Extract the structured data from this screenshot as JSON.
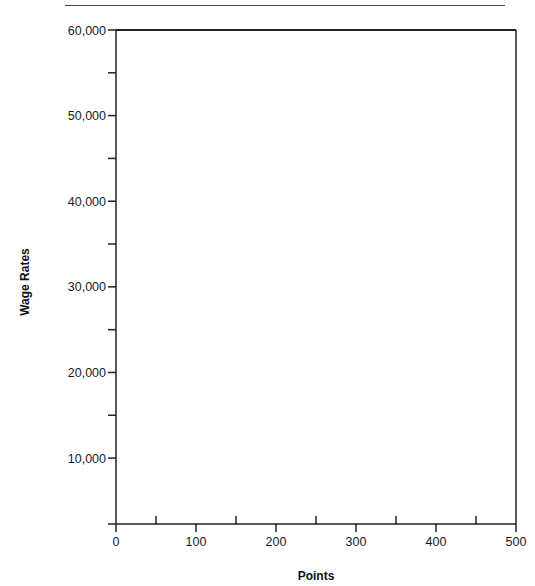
{
  "header": {
    "text": "…ing … g…"
  },
  "chart_data": {
    "type": "scatter",
    "title": "",
    "xlabel": "Points",
    "ylabel": "Wage Rates",
    "xlim": [
      0,
      500
    ],
    "ylim": [
      2300,
      60000
    ],
    "x_ticks": [
      0,
      100,
      200,
      300,
      400,
      500
    ],
    "x_tick_labels": [
      "0",
      "100",
      "200",
      "300",
      "400",
      "500"
    ],
    "x_minor_ticks": [
      50,
      150,
      250,
      350,
      450
    ],
    "y_ticks": [
      10000,
      20000,
      30000,
      40000,
      50000,
      60000
    ],
    "y_tick_labels": [
      "10,000",
      "20,000",
      "30,000",
      "40,000",
      "50,000",
      "60,000"
    ],
    "y_minor_ticks": [
      15000,
      25000,
      35000,
      45000,
      55000
    ],
    "grid": false,
    "legend": null,
    "series": [],
    "note": "Blank plotting grid with no data points plotted"
  }
}
